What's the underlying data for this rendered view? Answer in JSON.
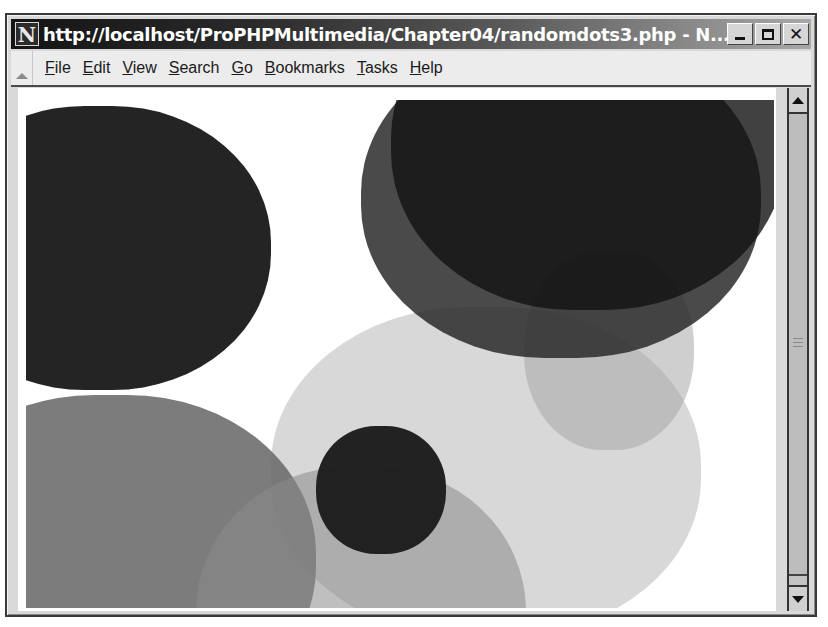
{
  "window": {
    "title": "http://localhost/ProPHPMultimedia/Chapter04/randomdots3.php - N...",
    "app_icon_letter": "N",
    "controls": {
      "minimize": "minimize",
      "maximize": "maximize",
      "close": "✕"
    }
  },
  "menubar": {
    "items": [
      {
        "label": "File",
        "accel": "F"
      },
      {
        "label": "Edit",
        "accel": "E"
      },
      {
        "label": "View",
        "accel": "V"
      },
      {
        "label": "Search",
        "accel": "S"
      },
      {
        "label": "Go",
        "accel": "G"
      },
      {
        "label": "Bookmarks",
        "accel": "B"
      },
      {
        "label": "Tasks",
        "accel": "T"
      },
      {
        "label": "Help",
        "accel": "H"
      }
    ]
  },
  "page": {
    "dots": [
      {
        "name": "dot-large-light",
        "x": 245,
        "y": 207,
        "w": 430,
        "h": 330,
        "color": "#b8b8b8",
        "opacity": 0.55
      },
      {
        "name": "dot-mid-gray-left",
        "x": -120,
        "y": 295,
        "w": 410,
        "h": 330,
        "color": "#6e6e6e",
        "opacity": 0.9
      },
      {
        "name": "dot-mid-gray-bottom",
        "x": 170,
        "y": 367,
        "w": 330,
        "h": 300,
        "color": "#8a8a8a",
        "opacity": 0.55
      },
      {
        "name": "dot-light-right",
        "x": 498,
        "y": 150,
        "w": 170,
        "h": 200,
        "color": "#a8a8a8",
        "opacity": 0.55
      },
      {
        "name": "dot-dark-top-right-outer",
        "x": 335,
        "y": -60,
        "w": 400,
        "h": 318,
        "color": "#2a2a2a",
        "opacity": 0.85
      },
      {
        "name": "dot-dark-top-right-inner",
        "x": 365,
        "y": -120,
        "w": 395,
        "h": 330,
        "color": "#111111",
        "opacity": 0.8
      },
      {
        "name": "dot-dark-top-left",
        "x": -100,
        "y": 6,
        "w": 345,
        "h": 284,
        "color": "#202020",
        "opacity": 0.98
      },
      {
        "name": "dot-dark-small-center",
        "x": 290,
        "y": 326,
        "w": 130,
        "h": 128,
        "color": "#1c1c1c",
        "opacity": 0.97
      }
    ]
  },
  "scrollbar": {
    "up": "scroll-up",
    "down": "scroll-down"
  }
}
